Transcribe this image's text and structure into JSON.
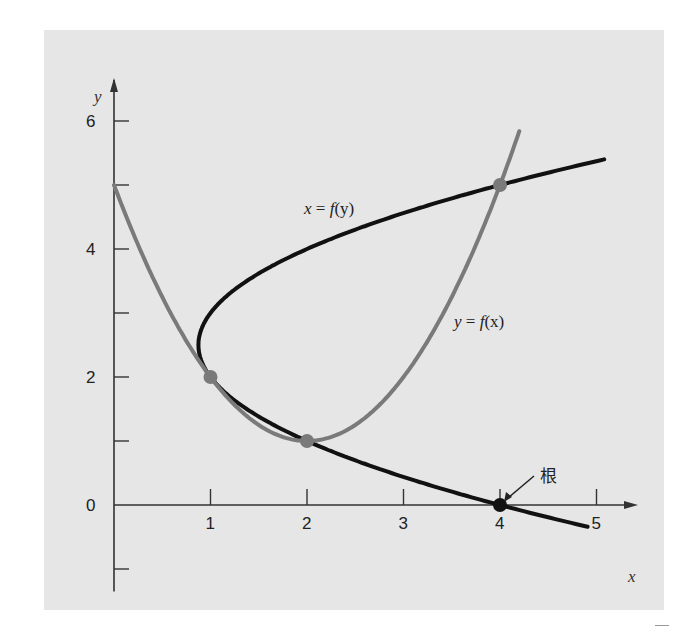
{
  "chart_data": {
    "type": "line",
    "title": "",
    "xlabel": "x",
    "ylabel": "y",
    "xlim": [
      0,
      5.2
    ],
    "ylim": [
      -1.2,
      6.7
    ],
    "x_ticks": [
      1,
      2,
      3,
      4,
      5
    ],
    "x_tick_labels": [
      "1",
      "2",
      "3",
      "4",
      "5"
    ],
    "y_ticks": [
      -1,
      0,
      1,
      2,
      3,
      4,
      5,
      6
    ],
    "y_tick_labels": [
      "0",
      "2",
      "4",
      "6"
    ],
    "y_labeled_ticks": [
      0,
      2,
      4,
      6
    ],
    "grid": false,
    "series": [
      {
        "name": "y = f(x)",
        "color": "#7a7a7a",
        "equation": "y = x^2 - 4x + 5",
        "x": [
          0,
          0.5,
          1,
          1.5,
          2,
          2.5,
          3,
          3.5,
          4,
          4.2
        ],
        "y": [
          5,
          3.25,
          2,
          1.25,
          1,
          1.25,
          2,
          3.25,
          5,
          5.84
        ]
      },
      {
        "name": "x = f(y)",
        "color": "#111111",
        "equation": "x = 0.5y^2 - 2.5y + 4",
        "y": [
          -0.3,
          0,
          0.5,
          1,
          1.5,
          2,
          2.5,
          3,
          3.5,
          4,
          4.5,
          5,
          5.4
        ],
        "x": [
          4.8,
          4,
          2.875,
          2,
          1.375,
          1,
          0.875,
          1,
          1.375,
          2,
          2.875,
          4,
          5.08
        ]
      }
    ],
    "points": [
      {
        "x": 1,
        "y": 2,
        "color": "#7a7a7a",
        "label": ""
      },
      {
        "x": 2,
        "y": 1,
        "color": "#7a7a7a",
        "label": ""
      },
      {
        "x": 4,
        "y": 5,
        "color": "#7a7a7a",
        "label": ""
      },
      {
        "x": 4,
        "y": 0,
        "color": "#111111",
        "label": "根"
      }
    ],
    "annotations": [
      {
        "text": "x = f(y)",
        "x": 2.0,
        "y": 4.55
      },
      {
        "text": "y = f(x)",
        "x": 3.25,
        "y": 2.9
      },
      {
        "text": "根",
        "x": 4.2,
        "y": 0.35,
        "arrow_to": [
          4,
          0
        ]
      }
    ]
  },
  "labels": {
    "x_axis": "x",
    "y_axis": "y",
    "x_ticks": [
      "1",
      "2",
      "3",
      "4",
      "5"
    ],
    "y_ticks": [
      "0",
      "2",
      "4",
      "6"
    ],
    "curve_xfy_prefix": "x",
    "curve_xfy_eq": " = ",
    "curve_xfy_fn": "f",
    "curve_xfy_arg": "(y)",
    "curve_yfx_prefix": "y",
    "curve_yfx_eq": " = ",
    "curve_yfx_fn": "f",
    "curve_yfx_arg": "(x)",
    "root": "根"
  },
  "colors": {
    "panel_bg": "#e6e6e6",
    "curve_fx": "#7a7a7a",
    "curve_fy": "#111111",
    "axis": "#333333"
  }
}
